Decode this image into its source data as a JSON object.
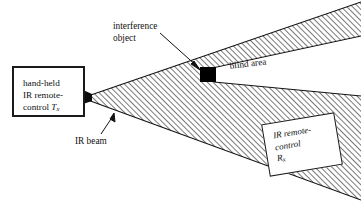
{
  "figure": {
    "background_color": "#ffffff",
    "ink_color": "#111111",
    "hatch_color": "#1a1a1a",
    "width": 361,
    "height": 202
  },
  "transmitter": {
    "line1": "hand-held",
    "line2": "IR remote-",
    "line3_prefix": "control ",
    "symbol": "T",
    "symbol_subscript": "x",
    "full_text": "hand-held IR remote-control Tx"
  },
  "receiver": {
    "line1": "IR remote-",
    "line2": "control",
    "symbol": "R",
    "symbol_subscript": "x",
    "full_text": "IR remote-control Rx"
  },
  "labels": {
    "interference_object_line1": "interference",
    "interference_object_line2": "object",
    "blind_area": "blind area",
    "ir_beam": "IR beam"
  },
  "elements": {
    "interference_object_shape": "filled-black-square",
    "beam_shape": "hatched-cone",
    "shadow_shape": "white-wedge"
  }
}
